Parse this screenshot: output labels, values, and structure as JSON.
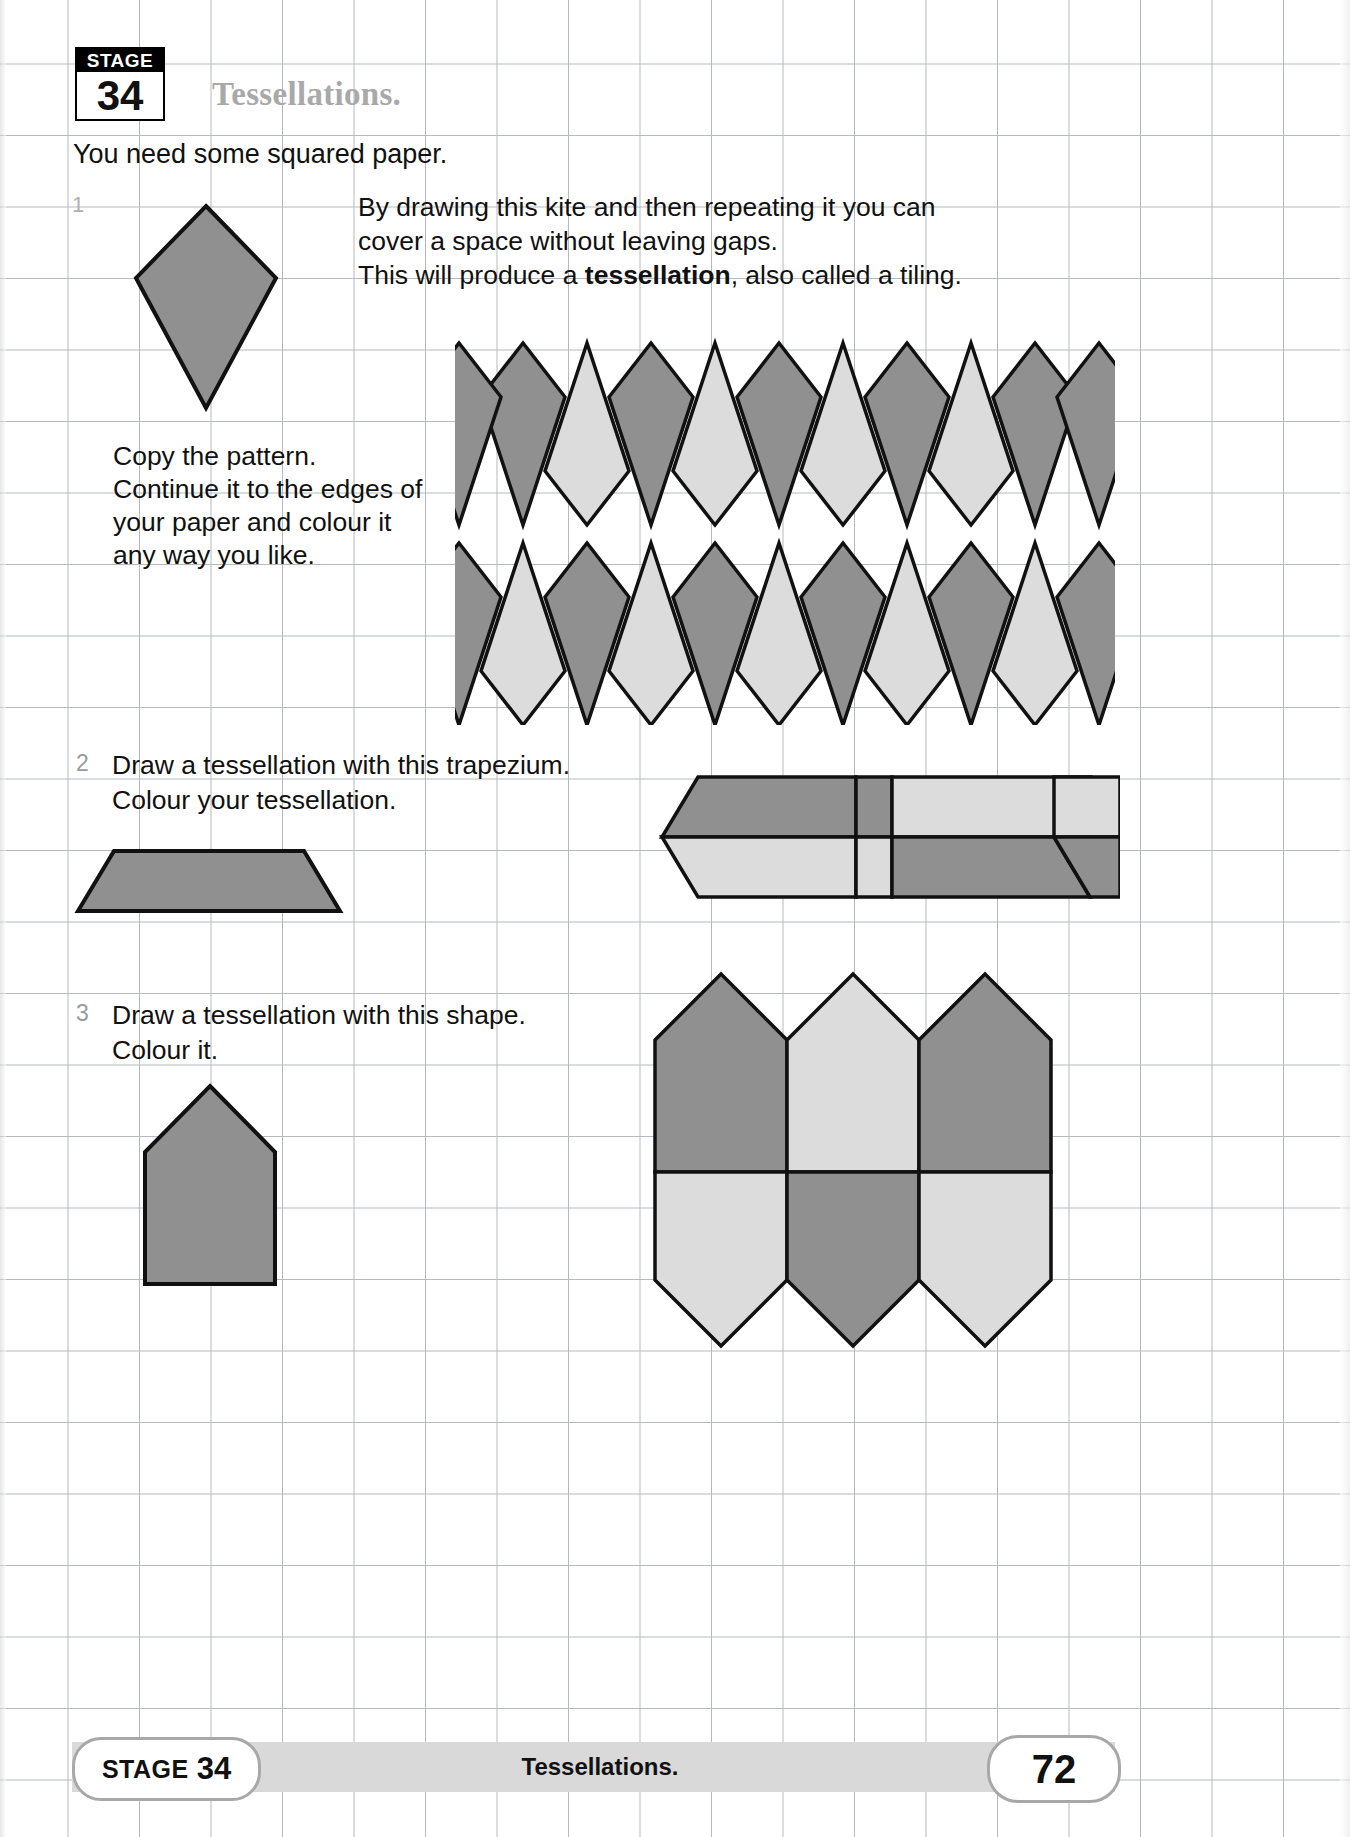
{
  "header": {
    "stage_word": "STAGE",
    "stage_number": "34",
    "title": "Tessellations."
  },
  "intro": {
    "line": "You need some squared paper."
  },
  "questions": [
    {
      "number": "1",
      "paragraph_line_1": "By drawing this kite and then repeating it you can",
      "paragraph_line_2": "cover a space without leaving gaps.",
      "paragraph_line_3_pre": "This will produce a ",
      "paragraph_line_3_bold": "tessellation",
      "paragraph_line_3_post": ", also called a tiling.",
      "instructions": "Copy the pattern.\nContinue it to the edges of\nyour paper and colour it\nany way you like."
    },
    {
      "number": "2",
      "text": "Draw a tessellation with this trapezium.\nColour your tessellation."
    },
    {
      "number": "3",
      "text": "Draw a tessellation with this shape.\nColour it."
    }
  ],
  "footer": {
    "stage_word": "STAGE",
    "stage_number": "34",
    "title": "Tessellations.",
    "page_number": "72"
  },
  "colors": {
    "shape_dark": "#909090",
    "shape_light": "#dcdcdc",
    "outline": "#111111",
    "grid_line": "#9aa0a6",
    "title_gray": "#a9a9a9",
    "footer_bar": "#d9d9d9"
  }
}
